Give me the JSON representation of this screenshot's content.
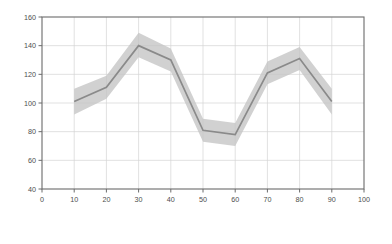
{
  "chart_data": {
    "type": "line",
    "title": "",
    "subtitle": "",
    "xlabel": "",
    "ylabel": "",
    "x": [
      10,
      20,
      30,
      40,
      50,
      60,
      70,
      80,
      90
    ],
    "series": [
      {
        "name": "value",
        "values": [
          101,
          111,
          140,
          130,
          81,
          78,
          121,
          131,
          101
        ],
        "band_upper": [
          110,
          119,
          149,
          138,
          89,
          86,
          129,
          139,
          110
        ],
        "band_lower": [
          92,
          103,
          132,
          122,
          73,
          70,
          113,
          123,
          92
        ],
        "line_color": "#8a8a8a",
        "band_color": "#c4c4c4"
      }
    ],
    "xlim": [
      0,
      100
    ],
    "ylim": [
      40,
      160
    ],
    "x_ticks": [
      0,
      10,
      20,
      30,
      40,
      50,
      60,
      70,
      80,
      90,
      100
    ],
    "x_tick_labels": [
      "0",
      "10",
      "20",
      "30",
      "40",
      "50",
      "60",
      "70",
      "80",
      "90",
      "100"
    ],
    "y_ticks": [
      40,
      60,
      80,
      100,
      120,
      140,
      160
    ],
    "y_tick_labels": [
      "40",
      "60",
      "80",
      "100",
      "120",
      "140",
      "160"
    ],
    "grid": true,
    "grid_color": "#d4d4d4",
    "axis_color": "#6b6b6b",
    "background_color": "#ffffff",
    "legend": null,
    "legend_position": "none",
    "annotations": []
  }
}
